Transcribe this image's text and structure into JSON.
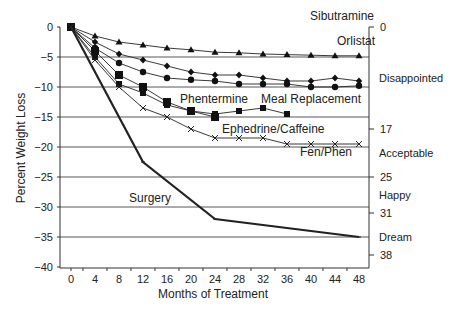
{
  "chart_data": {
    "type": "line",
    "title": "",
    "xlabel": "Months of Treatment",
    "ylabel": "Percent Weight Loss",
    "x_ticks": [
      0,
      4,
      8,
      12,
      16,
      20,
      24,
      28,
      32,
      36,
      40,
      44,
      48
    ],
    "y_ticks": [
      0,
      -5,
      -10,
      -15,
      -20,
      -25,
      -30,
      -35,
      -40
    ],
    "ylim": [
      -40,
      0
    ],
    "xlim": [
      0,
      48
    ],
    "grid": "horizontal at -5, -10, -15, -20, -25, -30, -35",
    "right_axis": {
      "ticks": [
        "0",
        "17",
        "25",
        "31",
        "38"
      ],
      "tick_values": [
        0,
        -17,
        -25,
        -31,
        -38
      ],
      "zones": [
        {
          "label": "Disappointed",
          "y": -8.5
        },
        {
          "label": "Acceptable",
          "y": -21
        },
        {
          "label": "Happy",
          "y": -28
        },
        {
          "label": "Dream",
          "y": -35
        }
      ]
    },
    "series": [
      {
        "name": "Sibutramine",
        "marker": "triangle",
        "x": [
          0,
          4,
          8,
          12,
          16,
          20,
          24,
          28,
          32,
          36,
          40,
          44,
          48
        ],
        "values": [
          0,
          -1.5,
          -2.5,
          -3,
          -3.5,
          -3.8,
          -4.2,
          -4.3,
          -4.5,
          -4.6,
          -4.7,
          -4.8,
          -4.8
        ],
        "label_pos": [
          310,
          20
        ]
      },
      {
        "name": "Orlistat",
        "marker": "diamond",
        "x": [
          0,
          4,
          8,
          12,
          16,
          20,
          24,
          28,
          32,
          36,
          40,
          44,
          48
        ],
        "values": [
          0,
          -2.5,
          -4.5,
          -5.5,
          -6.5,
          -7.5,
          -8,
          -8,
          -8.5,
          -9,
          -9,
          -8.5,
          -9
        ],
        "label_pos": [
          337,
          45
        ]
      },
      {
        "name": "Meal Replacement",
        "marker": "circle",
        "x": [
          0,
          4,
          8,
          12,
          16,
          20,
          24,
          28,
          32,
          36,
          40,
          44,
          48
        ],
        "values": [
          0,
          -3.5,
          -6,
          -7.5,
          -8.5,
          -8.8,
          -9,
          -9.5,
          -9.5,
          -9.5,
          -10,
          -10,
          -9.8
        ],
        "label_pos": [
          261,
          103
        ]
      },
      {
        "name": "Phentermine",
        "marker": "square",
        "x": [
          0,
          4,
          8,
          12,
          16,
          20,
          24
        ],
        "values": [
          0,
          -4,
          -8,
          -10,
          -12.5,
          -14,
          -15
        ],
        "label_pos": [
          180,
          103
        ]
      },
      {
        "name": "Ephedrine/Caffeine",
        "marker": "small-square",
        "x": [
          0,
          4,
          8,
          12,
          16,
          20,
          24,
          28,
          32,
          36
        ],
        "values": [
          0,
          -5,
          -9.5,
          -11,
          -13,
          -14,
          -14.5,
          -14,
          -13.5,
          -14.5
        ],
        "label_pos": [
          222,
          133
        ]
      },
      {
        "name": "Fen/Phen",
        "marker": "x",
        "x": [
          0,
          4,
          8,
          12,
          16,
          20,
          24,
          28,
          32,
          36,
          40,
          44,
          48
        ],
        "values": [
          0,
          -5.5,
          -10,
          -13.5,
          -15,
          -17,
          -18.5,
          -18.5,
          -18.5,
          -19.5,
          -19.5,
          -19.5,
          -19.5
        ],
        "label_pos": [
          300,
          156
        ]
      },
      {
        "name": "Surgery",
        "marker": "none",
        "x": [
          0,
          12,
          24,
          48
        ],
        "values": [
          0,
          -22.5,
          -32,
          -35
        ],
        "label_pos": [
          129,
          202
        ]
      }
    ]
  }
}
